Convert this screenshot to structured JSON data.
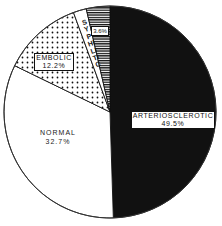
{
  "chart_data": {
    "type": "pie",
    "title": "",
    "categories": [
      "ARTERIOSCLEROTIC",
      "NORMAL",
      "EMBOLIC",
      "SYPHILITIC"
    ],
    "values": [
      49.5,
      32.7,
      12.2,
      3.6
    ],
    "unit": "%",
    "labels": {
      "arteriosclerotic": {
        "name": "ARTERIOSCLEROTIC",
        "value": "49.5%"
      },
      "normal": {
        "name": "NORMAL",
        "value": "32.7%"
      },
      "embolic": {
        "name": "EMBOLIC",
        "value": "12.2%"
      },
      "syphilitic": {
        "name": "SYPHILITIC",
        "value": "3.6%"
      }
    },
    "fills": {
      "arteriosclerotic": "solid-black",
      "normal": "white",
      "embolic": "dotted",
      "syphilitic": "horizontal-hatch"
    },
    "legend": "none",
    "grid": false,
    "start_angle_deg": 0,
    "direction": "clockwise"
  },
  "colors": {
    "ink": "#111111",
    "paper": "#ffffff"
  }
}
